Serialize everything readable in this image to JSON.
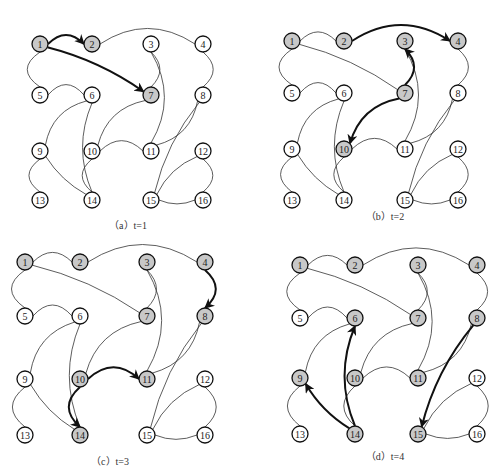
{
  "figure": {
    "colors": {
      "visited": "#c8c8c8",
      "unvisited": "#ffffff",
      "stroke": "#111111",
      "edge": "#333333"
    },
    "edges": [
      [
        1,
        2
      ],
      [
        1,
        5
      ],
      [
        1,
        7
      ],
      [
        2,
        4
      ],
      [
        3,
        7
      ],
      [
        3,
        11
      ],
      [
        4,
        8
      ],
      [
        5,
        6
      ],
      [
        6,
        9
      ],
      [
        6,
        14
      ],
      [
        7,
        10
      ],
      [
        8,
        11
      ],
      [
        8,
        15
      ],
      [
        9,
        13
      ],
      [
        9,
        14
      ],
      [
        10,
        11
      ],
      [
        10,
        14
      ],
      [
        12,
        15
      ],
      [
        12,
        16
      ],
      [
        15,
        16
      ]
    ],
    "panels": [
      {
        "id": "a",
        "caption": "（a）t=1",
        "caption_pos": [
          128,
          229
        ],
        "xs": [
          40,
          92,
          151,
          203
        ],
        "ys": [
          44,
          95,
          151,
          200
        ],
        "visited": [
          1,
          2,
          7
        ],
        "arrows": [
          [
            1,
            2
          ],
          [
            1,
            7
          ]
        ]
      },
      {
        "id": "b",
        "caption": "（b）t=2",
        "caption_pos": [
          385,
          220
        ],
        "xs": [
          292,
          344,
          405,
          458
        ],
        "ys": [
          41,
          93,
          149,
          200
        ],
        "visited": [
          1,
          2,
          3,
          4,
          7,
          10
        ],
        "arrows": [
          [
            2,
            4
          ],
          [
            7,
            3
          ],
          [
            7,
            10
          ]
        ]
      },
      {
        "id": "c",
        "caption": "（c）t=3",
        "caption_pos": [
          110,
          465
        ],
        "xs": [
          25,
          80,
          147,
          205
        ],
        "ys": [
          262,
          316,
          379,
          435
        ],
        "visited": [
          1,
          2,
          3,
          4,
          7,
          8,
          10,
          11,
          14
        ],
        "arrows": [
          [
            4,
            8
          ],
          [
            10,
            11
          ],
          [
            10,
            14
          ]
        ]
      },
      {
        "id": "d",
        "caption": "（d）t=4",
        "caption_pos": [
          385,
          460
        ],
        "xs": [
          300,
          355,
          418,
          477
        ],
        "ys": [
          265,
          318,
          378,
          434
        ],
        "visited": [
          1,
          2,
          3,
          4,
          6,
          7,
          8,
          9,
          10,
          11,
          14,
          15
        ],
        "arrows": [
          [
            8,
            15
          ],
          [
            14,
            6
          ],
          [
            14,
            9
          ]
        ]
      }
    ]
  }
}
